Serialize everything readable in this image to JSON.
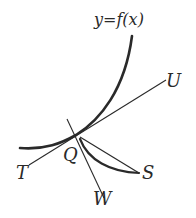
{
  "diagram": {
    "labels": {
      "curve": "y=f(x)",
      "point": "Q",
      "tangent_end_upper": "U",
      "tangent_end_lower": "T",
      "normal_end": "W",
      "secant_end": "S"
    },
    "colors": {
      "stroke": "#2a2a2a",
      "background": "#ffffff"
    }
  }
}
